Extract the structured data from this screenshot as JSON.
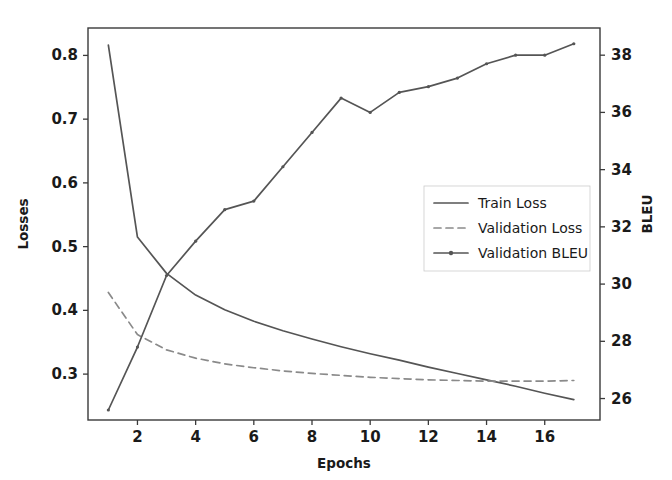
{
  "chart_data": {
    "type": "line",
    "title": "",
    "xlabel": "Epochs",
    "ylabel": "Losses",
    "y2label": "BLEU",
    "grid": false,
    "legend_position": "center-right",
    "xlim": [
      0.3,
      17.9
    ],
    "ylim": [
      0.228,
      0.843
    ],
    "y2lim": [
      25.25,
      38.95
    ],
    "xticks": [
      2,
      4,
      6,
      8,
      10,
      12,
      14,
      16
    ],
    "xticklabels": [
      "2",
      "4",
      "6",
      "8",
      "10",
      "12",
      "14",
      "16"
    ],
    "yticks": [
      0.3,
      0.4,
      0.5,
      0.6,
      0.7,
      0.8
    ],
    "yticklabels": [
      "0.3",
      "0.4",
      "0.5",
      "0.6",
      "0.7",
      "0.8"
    ],
    "y2ticks": [
      26,
      28,
      30,
      32,
      34,
      36,
      38
    ],
    "y2ticklabels": [
      "26",
      "28",
      "30",
      "32",
      "34",
      "36",
      "38"
    ],
    "x": [
      1,
      2,
      3,
      4,
      5,
      6,
      7,
      8,
      9,
      10,
      11,
      12,
      13,
      14,
      15,
      16,
      17
    ],
    "series": [
      {
        "name": "Train Loss",
        "axis": "left",
        "style": "solid",
        "marker": "none",
        "color": "#555555",
        "values": [
          0.816,
          0.515,
          0.458,
          0.424,
          0.401,
          0.383,
          0.368,
          0.355,
          0.343,
          0.332,
          0.322,
          0.311,
          0.301,
          0.291,
          0.281,
          0.27,
          0.26
        ]
      },
      {
        "name": "Validation Loss",
        "axis": "left",
        "style": "dashed",
        "marker": "none",
        "color": "#8a8a8a",
        "values": [
          0.428,
          0.362,
          0.338,
          0.325,
          0.316,
          0.31,
          0.305,
          0.301,
          0.298,
          0.295,
          0.293,
          0.291,
          0.29,
          0.289,
          0.289,
          0.289,
          0.29
        ]
      },
      {
        "name": "Validation BLEU",
        "axis": "right",
        "style": "solid",
        "marker": "point",
        "color": "#555555",
        "values": [
          25.6,
          27.8,
          30.3,
          31.5,
          32.6,
          32.9,
          34.1,
          35.3,
          36.5,
          36.0,
          36.7,
          36.9,
          37.2,
          37.7,
          38.0,
          38.0,
          38.4
        ]
      }
    ],
    "legend_entries": [
      "Train Loss",
      "Validation Loss",
      "Validation BLEU"
    ]
  },
  "axes": {
    "x_title": "Epochs",
    "y_left_title": "Losses",
    "y_right_title": "BLEU"
  },
  "legend": {
    "items": [
      {
        "label": "Train Loss"
      },
      {
        "label": "Validation Loss"
      },
      {
        "label": "Validation BLEU"
      }
    ]
  },
  "colors": {
    "train_loss": "#555555",
    "validation_loss": "#8a8a8a",
    "validation_bleu": "#555555",
    "axis": "#3a3a3a",
    "text": "#1a1a1a",
    "background": "#ffffff"
  }
}
